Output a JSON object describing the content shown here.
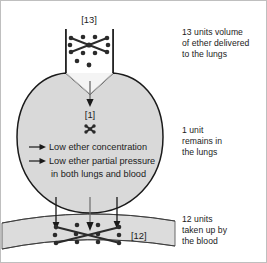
{
  "diagram": {
    "title_alt": "Ether uptake in lungs and blood",
    "labels": {
      "trachea": "[13]",
      "lung": "[1]",
      "blood": "[12]"
    },
    "lung_notes": [
      "Low ether concentration",
      "Low ether partial pressure",
      "in both lungs and blood"
    ],
    "counts": {
      "delivered_units": 13,
      "remaining_units": 1,
      "absorbed_units": 12
    },
    "colors": {
      "organ_fill": "#d9d9d9",
      "vessel_fill": "#dcdcdc",
      "outline": "#1a1a1a",
      "dot": "#2b2b2b",
      "text": "#1b1b1b",
      "background": "#ffffff",
      "frame": "#bfbfbf"
    }
  },
  "annotations": {
    "top": "13 units volume\nof ether delivered\nto the lungs",
    "middle": "1 unit\nremains in\nthe lungs",
    "bottom": "12 units\ntaken up by\nthe blood"
  }
}
